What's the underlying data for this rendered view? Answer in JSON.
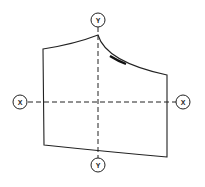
{
  "diagram": {
    "type": "pattern-piece",
    "axes": {
      "vertical": {
        "top_label": "Y",
        "bottom_label": "Y"
      },
      "horizontal": {
        "left_label": "X",
        "right_label": "X"
      }
    },
    "stroke_color": "#222222",
    "background": "#ffffff"
  }
}
